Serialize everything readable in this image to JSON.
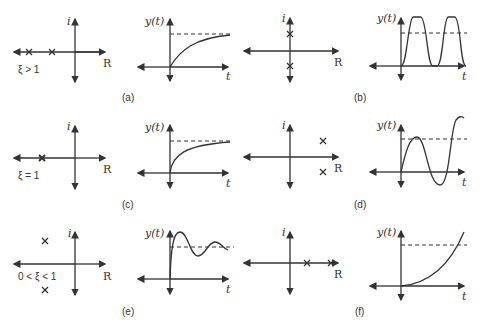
{
  "figure": {
    "panels": [
      {
        "id": "a",
        "caption": "(a)",
        "condition": "ξ > 1",
        "poles": "two distinct negative real poles",
        "response": "overdamped exponential rise"
      },
      {
        "id": "b",
        "caption": "(b)",
        "condition": "",
        "poles": "pair on imaginary axis",
        "response": "sustained oscillation"
      },
      {
        "id": "c",
        "caption": "(c)",
        "condition": "ξ = 1",
        "poles": "double negative real pole",
        "response": "critically damped rise"
      },
      {
        "id": "d",
        "caption": "(d)",
        "condition": "",
        "poles": "complex pair in right half-plane",
        "response": "growing oscillation"
      },
      {
        "id": "e",
        "caption": "(e)",
        "condition": "0 < ξ < 1",
        "poles": "complex pair in left half-plane",
        "response": "damped oscillation"
      },
      {
        "id": "f",
        "caption": "(f)",
        "condition": "",
        "poles": "two positive real poles",
        "response": "unbounded exponential growth"
      }
    ],
    "axis_labels": {
      "imag": "i",
      "real": "R",
      "y": "y(t)",
      "t": "t"
    }
  }
}
